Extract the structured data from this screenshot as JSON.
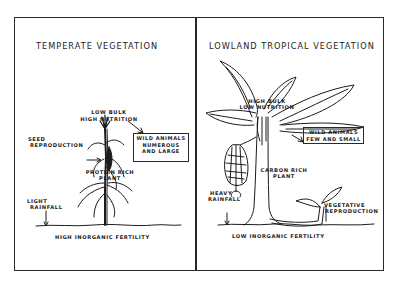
{
  "left_panel": {
    "title": "TEMPERATE VEGETATION",
    "labels": {
      "top_line1": "LOW BULK",
      "top_line2": "HIGH NUTRITION",
      "seed_line1": "SEED",
      "seed_line2": "REPRODUCTION",
      "plant_line1": "PROTEIN RICH",
      "plant_line2": "PLANT",
      "rain_line1": "LIGHT",
      "rain_line2": "RAINFALL",
      "fertility": "HIGH INORGANIC FERTILITY"
    },
    "animals_box": {
      "line1": "WILD ANIMALS",
      "line2": "NUMEROUS",
      "line3": "AND LARGE"
    },
    "plant_icon": "corn-plant-icon"
  },
  "right_panel": {
    "title": "LOWLAND TROPICAL VEGETATION",
    "labels": {
      "top_line1": "HIGH BULK",
      "top_line2": "LOW NUTRITION",
      "plant_line1": "CARBON RICH",
      "plant_line2": "PLANT",
      "rain_line1": "HEAVY",
      "rain_line2": "RAINFALL",
      "veg_line1": "VEGETATIVE",
      "veg_line2": "REPRODUCTION",
      "fertility": "LOW INORGANIC FERTILITY"
    },
    "animals_box": {
      "line1": "WILD ANIMALS",
      "line2": "FEW AND SMALL"
    },
    "plant_icon": "banana-plant-icon"
  },
  "colors": {
    "ink": "#1c1c1c",
    "background": "#ffffff"
  }
}
